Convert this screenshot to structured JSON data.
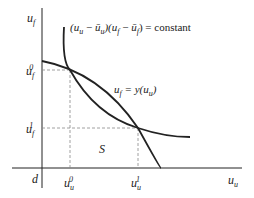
{
  "diagram": {
    "axes": {
      "y_label_main": "u",
      "y_label_sub": "f",
      "x_label_main": "u",
      "x_label_sub": "u",
      "origin_label": "d"
    },
    "curves": {
      "hyperbola_label": "(uᵤ − ūᵤ)(u_f − ū_f) = constant",
      "hyperbola_text_a": "(u",
      "hyperbola_text_b": "u",
      "hyperbola_text_c": " − ",
      "hyperbola_text_d": "ū",
      "hyperbola_text_e": "u",
      "hyperbola_text_f": ")(u",
      "hyperbola_text_g": "f",
      "hyperbola_text_h": " − ",
      "hyperbola_text_i": "ū",
      "hyperbola_text_j": "f",
      "hyperbola_text_k": ") = constant",
      "frontier_label_a": "u",
      "frontier_label_b": "f",
      "frontier_label_c": " = y(u",
      "frontier_label_d": "u",
      "frontier_label_e": ")"
    },
    "ticks": {
      "uf0_main": "u",
      "uf0_sub": "f",
      "uf0_sup": "0",
      "uf1_main": "u",
      "uf1_sub": "f",
      "uf1_sup": "1",
      "uu0_main": "u",
      "uu0_sub": "u",
      "uu0_sup": "0",
      "uu1_main": "u",
      "uu1_sub": "u",
      "uu1_sup": "1"
    },
    "region_label": "S",
    "colors": {
      "stroke": "#222222",
      "dash": "#888888"
    }
  }
}
